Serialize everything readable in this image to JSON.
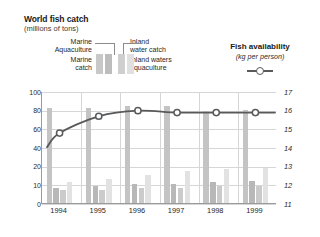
{
  "title": "World fish catch",
  "subtitle": "(millions of tons)",
  "legend_left": {
    "marine_aquaculture": "Marine\nAquaculture",
    "marine_aquaculture_l1": "Marine",
    "marine_aquaculture_l2": "Aquaculture",
    "marine_catch_l1": "Marine",
    "marine_catch_l2": "catch",
    "inland_water_catch_l1": "Inland",
    "inland_water_catch_l2": "water catch",
    "inland_waters_aquaculture_l1": "Inland waters",
    "inland_waters_aquaculture_l2": "aquaculture"
  },
  "legend_right": {
    "title": "Fish availability",
    "subtitle": "(kg per person)",
    "marker": "line-with-circle-marker"
  },
  "chart_data": {
    "type": "bar",
    "title": "World fish catch",
    "subtitle": "(millions of tons)",
    "xlabel": "",
    "ylabel": "(millions of tons)",
    "y2label": "Fish availability (kg per person)",
    "categories": [
      "1994",
      "1995",
      "1996",
      "1997",
      "1998",
      "1999"
    ],
    "ylim": [
      0,
      100
    ],
    "yticks": [
      0,
      10,
      20,
      40,
      60,
      80,
      100
    ],
    "y2lim": [
      11,
      17
    ],
    "y2ticks": [
      11,
      12,
      13,
      14,
      15,
      16,
      17
    ],
    "grid": true,
    "legend_position": "above-plot",
    "series": [
      {
        "name": "Marine catch",
        "values": [
          82,
          82,
          84,
          84,
          79,
          80
        ]
      },
      {
        "name": "Marine aquaculture",
        "values": [
          8,
          9,
          10,
          10,
          11,
          12
        ]
      },
      {
        "name": "Inland water catch",
        "values": [
          7,
          7,
          8,
          8,
          9,
          9
        ]
      },
      {
        "name": "Inland waters aquaculture",
        "values": [
          11,
          13,
          15,
          17,
          18,
          19
        ]
      }
    ],
    "line_series": {
      "name": "Fish availability",
      "units": "kg per person",
      "axis": "right",
      "x": [
        "1994",
        "1995",
        "1996",
        "1997",
        "1998",
        "1999"
      ],
      "values": [
        14.8,
        15.7,
        16.0,
        15.9,
        15.9,
        15.9
      ],
      "marker": "open-circle"
    }
  },
  "axis": {
    "y_left": [
      "100",
      "80",
      "60",
      "40",
      "20",
      "10",
      "0"
    ],
    "y_right": [
      "17",
      "16",
      "15",
      "14",
      "13",
      "12",
      "11"
    ],
    "x": [
      "1994",
      "1995",
      "1996",
      "1997",
      "1998",
      "1999"
    ]
  }
}
